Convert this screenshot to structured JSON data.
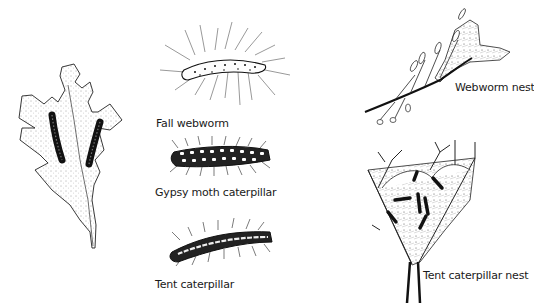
{
  "labels": {
    "fall_webworm": "Fall webworm",
    "gypsy_moth": "Gypsy moth caterpillar",
    "tent_caterpillar": "Tent caterpillar",
    "webworm_nest": "Webworm nest",
    "tent_caterpillar_nest": "Tent caterpillar nest"
  },
  "colors": {
    "ink": "#1a1a1a",
    "background": "#ffffff"
  }
}
